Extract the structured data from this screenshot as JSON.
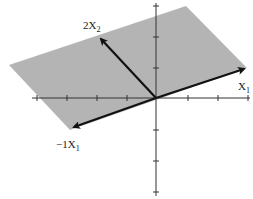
{
  "diagram": {
    "title": "",
    "labels": {
      "x1": "X",
      "x1_sub": "1",
      "x2": "2X",
      "x2_sub": "2",
      "neg_x1": "−1X",
      "neg_x1_sub": "1"
    },
    "colors": {
      "plane": "#b4b4b4",
      "axis": "#333333",
      "vector": "#111111"
    },
    "vectors": [
      {
        "name": "X1",
        "from": [
          156,
          98
        ],
        "to": [
          247,
          68
        ]
      },
      {
        "name": "2X2",
        "from": [
          156,
          98
        ],
        "to": [
          99,
          37
        ]
      },
      {
        "name": "-1X1",
        "from": [
          156,
          98
        ],
        "to": [
          72,
          128
        ]
      }
    ],
    "plane_vertices": [
      [
        9,
        65
      ],
      [
        186,
        6
      ],
      [
        247,
        68
      ],
      [
        70,
        130
      ]
    ]
  }
}
